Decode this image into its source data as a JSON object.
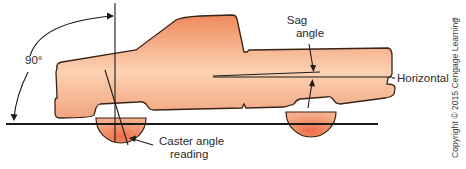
{
  "figure": {
    "labels": {
      "right_angle": "90°",
      "sag_angle_line1": "Sag",
      "sag_angle_line2": "angle",
      "horizontal": "Horizontal",
      "caster_line1": "Caster angle",
      "caster_line2": "reading"
    },
    "copyright": "Copyright © 2015 Cengage Learning",
    "copyright_mark": "®",
    "colors": {
      "truck_top": "#f08a5d",
      "truck_mid": "#f9c8a6",
      "truck_bottom": "#f2a47e",
      "wheel": "#ee7c55",
      "outline": "#3a2418",
      "ground": "#1e1a18"
    }
  }
}
